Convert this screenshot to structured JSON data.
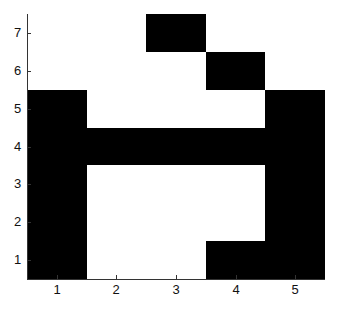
{
  "chart_data": {
    "type": "heatmap",
    "title": "",
    "xlabel": "",
    "ylabel": "",
    "x_ticks": [
      "1",
      "2",
      "3",
      "4",
      "5"
    ],
    "y_ticks": [
      "1",
      "2",
      "3",
      "4",
      "5",
      "6",
      "7"
    ],
    "xlim": [
      0.5,
      5.5
    ],
    "ylim": [
      0.5,
      7.5
    ],
    "colormap": {
      "0": "#ffffff",
      "1": "#000000"
    },
    "grid": false,
    "legend": null,
    "matrix_rows_top_to_bottom": [
      {
        "y": 7,
        "values": [
          0,
          0,
          1,
          0,
          0
        ]
      },
      {
        "y": 6,
        "values": [
          0,
          0,
          0,
          1,
          0
        ]
      },
      {
        "y": 5,
        "values": [
          1,
          0,
          0,
          0,
          1
        ]
      },
      {
        "y": 4,
        "values": [
          1,
          1,
          1,
          1,
          1
        ]
      },
      {
        "y": 3,
        "values": [
          1,
          0,
          0,
          0,
          1
        ]
      },
      {
        "y": 2,
        "values": [
          1,
          0,
          0,
          0,
          1
        ]
      },
      {
        "y": 1,
        "values": [
          1,
          0,
          0,
          1,
          1
        ]
      }
    ]
  },
  "axes": {
    "x_labels": [
      "1",
      "2",
      "3",
      "4",
      "5"
    ],
    "y_labels": [
      "1",
      "2",
      "3",
      "4",
      "5",
      "6",
      "7"
    ]
  }
}
